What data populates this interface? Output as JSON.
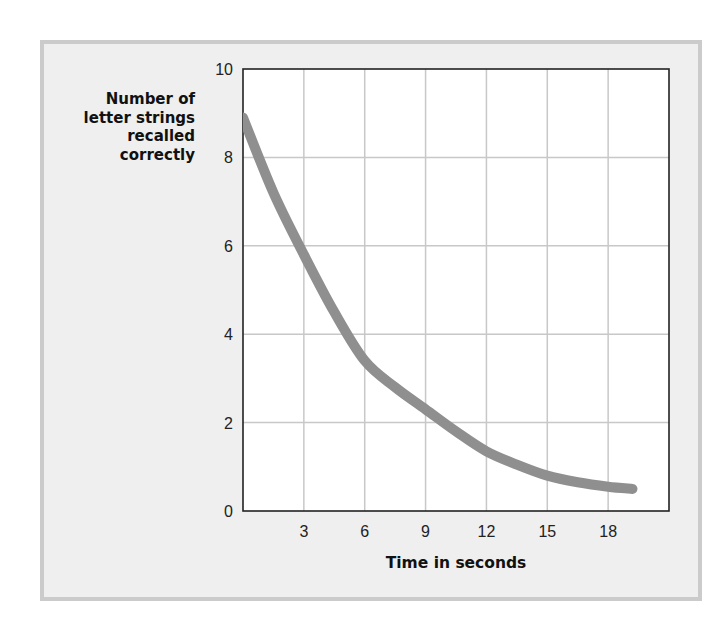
{
  "chart_data": {
    "type": "line",
    "title": "",
    "xlabel": "Time in seconds",
    "ylabel": "Number of letter strings recalled correctly",
    "ylabel_lines": [
      "Number of",
      "letter strings",
      "recalled",
      "correctly"
    ],
    "xlim": [
      0,
      21
    ],
    "ylim": [
      0,
      10
    ],
    "x_ticks": [
      3,
      6,
      9,
      12,
      15,
      18
    ],
    "y_ticks": [
      0,
      2,
      4,
      6,
      8,
      10
    ],
    "grid": true,
    "legend": null,
    "series": [
      {
        "name": "Recall",
        "color": "#8f8f8f",
        "x": [
          0,
          1.5,
          3,
          4.5,
          6,
          7.5,
          9,
          10.5,
          12,
          13.5,
          15,
          16.5,
          18,
          19.2
        ],
        "y": [
          8.9,
          7.2,
          5.8,
          4.5,
          3.4,
          2.8,
          2.3,
          1.8,
          1.35,
          1.05,
          0.8,
          0.65,
          0.55,
          0.5
        ]
      }
    ]
  },
  "labels": {
    "ylabel": "Number of\nletter strings\nrecalled\ncorrectly",
    "xlabel": "Time in seconds"
  },
  "colors": {
    "panel_bg": "#efefef",
    "panel_border": "#cbcbcb",
    "plot_bg": "#ffffff",
    "grid": "#c8c8c8",
    "axis": "#222222",
    "curve": "#8f8f8f"
  }
}
